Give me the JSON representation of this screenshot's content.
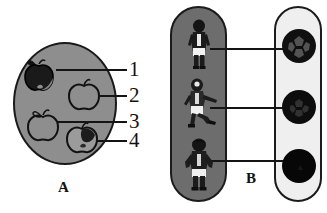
{
  "figure": {
    "background_color": "#ffffff",
    "outline_color": "#141414"
  },
  "panel_a": {
    "letter": "A",
    "dish": {
      "name": "round-dish",
      "fill_color": "#8e8e8e",
      "border_color": "#1a1a1a"
    },
    "items": [
      {
        "index": 1,
        "name": "apple-dark-top-left",
        "shading": "dark",
        "has_leaf": true,
        "fill_color": "#141414"
      },
      {
        "index": 2,
        "name": "apple-outline-top-right",
        "shading": "outline",
        "has_leaf": true,
        "fill_color": "#8e8e8e"
      },
      {
        "index": 3,
        "name": "apple-outline-bottom-left",
        "shading": "outline",
        "has_leaf": true,
        "fill_color": "#8e8e8e"
      },
      {
        "index": 4,
        "name": "apple-partial-dark-bottom-right",
        "shading": "partial-dark",
        "has_leaf": true,
        "fill_color": "#8e8e8e"
      }
    ],
    "callouts": [
      {
        "label": "1"
      },
      {
        "label": "2"
      },
      {
        "label": "3"
      },
      {
        "label": "4"
      }
    ]
  },
  "panel_b": {
    "letter": "B",
    "left_group": {
      "name": "people-group",
      "fill_color": "#6d6d6d",
      "border_color": "#1b1b1b",
      "people": [
        {
          "name": "person-standing-top",
          "pose": "standing"
        },
        {
          "name": "person-kicking-middle",
          "pose": "kicking"
        },
        {
          "name": "person-hands-on-hips-bottom",
          "pose": "hands-on-hips"
        }
      ]
    },
    "right_group": {
      "name": "balls-group",
      "fill_color": "#efefef",
      "border_color": "#1b1b1b",
      "balls": [
        {
          "name": "ball-patterned-top",
          "fill_color": "#141414",
          "pattern": "soccer-panels"
        },
        {
          "name": "ball-patterned-middle",
          "fill_color": "#111111",
          "pattern": "faint-panels"
        },
        {
          "name": "ball-solid-bottom",
          "fill_color": "#0a0a0a",
          "pattern": "solid"
        }
      ]
    },
    "connectors": [
      {
        "name": "connector-top"
      },
      {
        "name": "connector-middle"
      },
      {
        "name": "connector-bottom"
      }
    ]
  }
}
